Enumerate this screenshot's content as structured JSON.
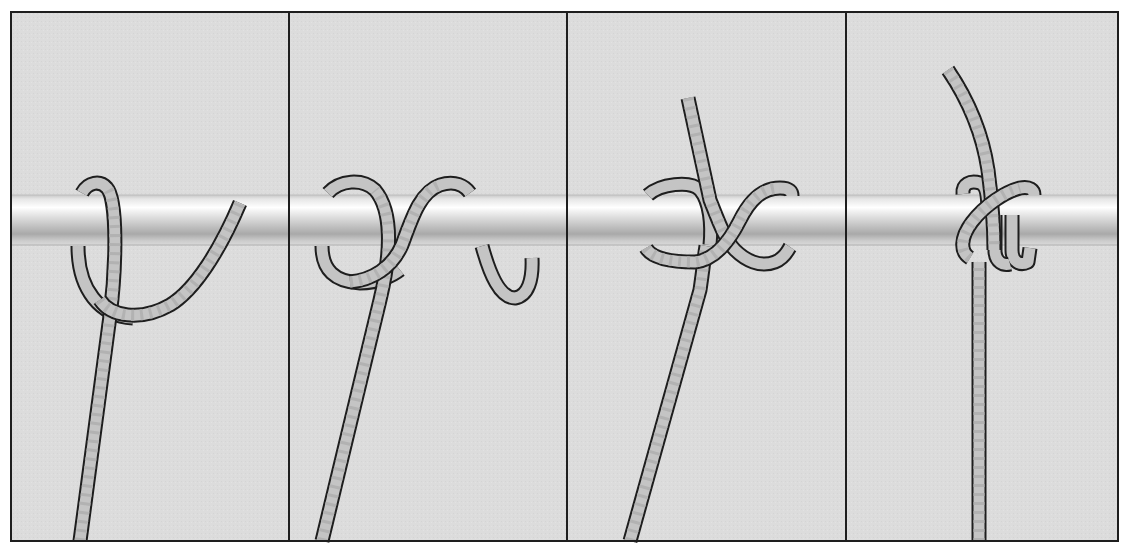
{
  "colors": {
    "page_bg": "#ffffff",
    "panel_bg": "#dcdcdc",
    "frame": "#1e1e1e",
    "rope_fill": "#c4c4c4",
    "rope_outline": "#1e1e1e",
    "bar_highlight": "#ffffff",
    "bar_shadow": "#a8a8a8"
  },
  "panels": [
    {
      "step": 1,
      "description": "Rope passed over the bar, working end crosses in front of standing part"
    },
    {
      "step": 2,
      "description": "Working end taken over the bar a second time, forming a second turn"
    },
    {
      "step": 3,
      "description": "Working end brought up and tucked under the crossing"
    },
    {
      "step": 4,
      "description": "Knot drawn tight around the bar"
    }
  ]
}
